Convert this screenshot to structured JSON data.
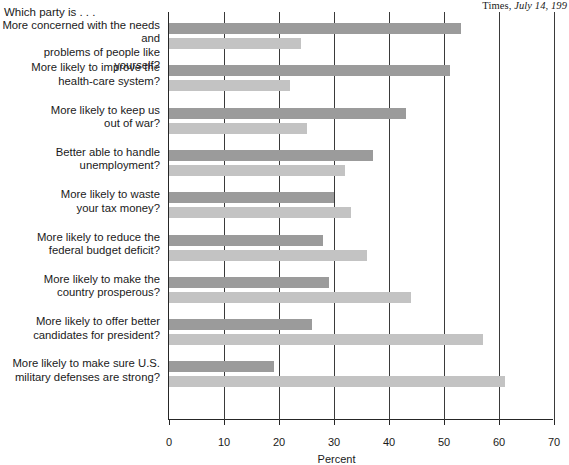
{
  "source_note": {
    "prefix": "Times, ",
    "italic": "July 14, 199"
  },
  "lead_in": "Which party is . . .",
  "axis": {
    "xlabel": "Percent",
    "ticks": [
      0,
      10,
      20,
      30,
      40,
      50,
      60,
      70
    ]
  },
  "colors": {
    "series_dark": "#9b9b9b",
    "series_light": "#c3c3c3",
    "axis": "#262626",
    "grid": "#3a3a3a",
    "text": "#1a1a1a"
  },
  "chart_data": {
    "type": "bar",
    "orientation": "horizontal",
    "title": "Which party is . . .",
    "subtitle": "",
    "xlabel": "Percent",
    "ylabel": "",
    "xlim": [
      0,
      70
    ],
    "xticks": [
      0,
      10,
      20,
      30,
      40,
      50,
      60,
      70
    ],
    "grid": true,
    "grid_axis": "x",
    "legend": "none",
    "annotations": [
      "Times, July 14, 199"
    ],
    "categories": [
      "More concerned with the needs and\nproblems of people like yourself?",
      "More likely to improve the\nhealth-care system?",
      "More likely to keep us\nout of war?",
      "Better able to handle\nunemployment?",
      "More likely to waste\nyour tax money?",
      "More likely to reduce the\nfederal budget deficit?",
      "More likely to make the\ncountry prosperous?",
      "More likely to offer better\ncandidates for president?",
      "More likely to make sure U.S.\nmilitary defenses are strong?"
    ],
    "series": [
      {
        "name": "series-dark",
        "color": "#9b9b9b",
        "values": [
          53,
          51,
          43,
          37,
          30,
          28,
          29,
          26,
          19
        ]
      },
      {
        "name": "series-light",
        "color": "#c3c3c3",
        "values": [
          24,
          22,
          25,
          32,
          33,
          36,
          44,
          57,
          61
        ]
      }
    ]
  }
}
